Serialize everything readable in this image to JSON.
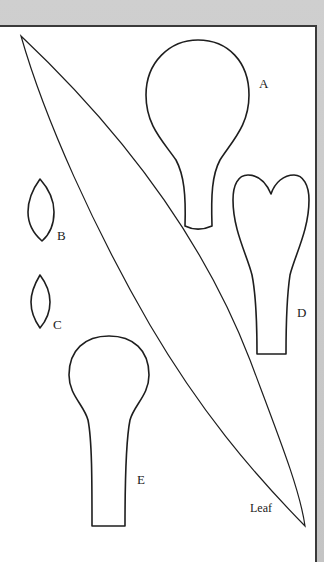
{
  "figure": {
    "type": "sewing/craft pattern template sheet",
    "colors": {
      "background": "#c9c9c9",
      "paper": "#ffffff",
      "outline": "#1e1e1e",
      "border": "#3a3a3a"
    },
    "pieces": [
      {
        "id": "A",
        "label": "A",
        "shape": "round petal with narrow stem"
      },
      {
        "id": "B",
        "label": "B",
        "shape": "small pointed oval"
      },
      {
        "id": "C",
        "label": "C",
        "shape": "smaller pointed oval"
      },
      {
        "id": "D",
        "label": "D",
        "shape": "heart-topped petal with long stem"
      },
      {
        "id": "E",
        "label": "E",
        "shape": "round petal with long stem"
      },
      {
        "id": "leaf",
        "label": "Leaf",
        "shape": "long diagonal lanceolate leaf"
      }
    ]
  }
}
